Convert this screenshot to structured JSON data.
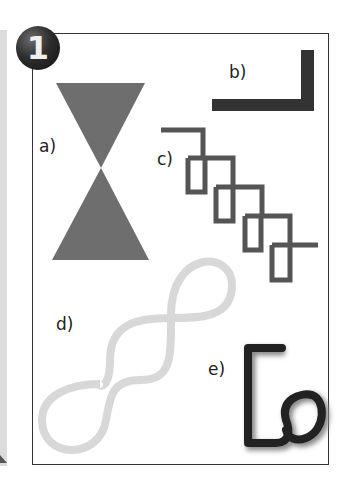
{
  "badge": {
    "number": "1"
  },
  "shapes": [
    {
      "id": "a",
      "label": "a)",
      "description": "hourglass (two triangles meeting at a point)",
      "color": "#6e6e6e"
    },
    {
      "id": "b",
      "label": "b)",
      "description": "L-shaped thick line",
      "color": "#333333"
    },
    {
      "id": "c",
      "label": "c)",
      "description": "chain of interlocking rectangular loops",
      "color": "#555555"
    },
    {
      "id": "d",
      "label": "d)",
      "description": "double figure-eight curved line",
      "color": "#d8d8d8"
    },
    {
      "id": "e",
      "label": "e)",
      "description": "hooked line ending in a loop",
      "color": "#222222"
    }
  ]
}
